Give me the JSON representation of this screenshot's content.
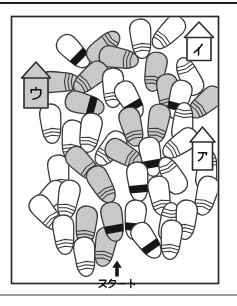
{
  "page": {
    "background": "#ffffff",
    "top_rule_color": "#1e1e1e",
    "bottom_rule_color": "#9b9b9b"
  },
  "figure": {
    "type": "footprint-maze-puzzle",
    "start_label": "スタート",
    "start_arrow": "up-arrow",
    "colors": {
      "outline": "#3a3a3a",
      "frame": "#2b2b2b",
      "white_sandal": "#ffffff",
      "gray_sandal": "#c8c8c8",
      "black_band": "#161616",
      "house_gray": "#cacaca",
      "house_white": "#ffffff",
      "text": "#111111"
    },
    "houses": [
      {
        "id": "i",
        "label": "イ",
        "fill": "#ffffff",
        "apex": [
          199,
          22
        ],
        "body": [
          187,
          37.5,
          24,
          23
        ]
      },
      {
        "id": "u",
        "label": "ウ",
        "fill": "#cacaca",
        "apex": [
          36,
          62
        ],
        "body": [
          24,
          78,
          24,
          30
        ]
      },
      {
        "id": "a",
        "label": "ア",
        "fill": "#ffffff",
        "apex": [
          202.5,
          127
        ],
        "body": [
          192.5,
          142,
          20,
          28
        ]
      }
    ],
    "footprint_fields": [
      "x",
      "y",
      "rotation_deg",
      "color",
      "band"
    ],
    "footprints": [
      [
        74,
        52,
        315,
        "white",
        "black"
      ],
      [
        104,
        47,
        225,
        "gray",
        "lines"
      ],
      [
        119,
        58,
        280,
        "gray",
        "lines"
      ],
      [
        141,
        39,
        355,
        "white",
        "lines"
      ],
      [
        168,
        33,
        45,
        "white",
        "lines"
      ],
      [
        60,
        82,
        270,
        "gray",
        "lines"
      ],
      [
        90,
        78,
        50,
        "gray",
        "lines"
      ],
      [
        113,
        88,
        0,
        "white",
        "lines"
      ],
      [
        85,
        104,
        285,
        "gray",
        "black"
      ],
      [
        155,
        72,
        10,
        "gray",
        "lines"
      ],
      [
        189,
        76,
        155,
        "white",
        "lines"
      ],
      [
        168,
        94,
        355,
        "gray",
        "lines"
      ],
      [
        130,
        100,
        330,
        "white",
        "black"
      ],
      [
        179,
        100,
        15,
        "white",
        "black"
      ],
      [
        205,
        103,
        50,
        "gray",
        "lines"
      ],
      [
        51,
        124,
        355,
        "white",
        "lines"
      ],
      [
        72,
        140,
        5,
        "white",
        "lines"
      ],
      [
        90,
        133,
        10,
        "white",
        "lines"
      ],
      [
        110,
        149,
        40,
        "white",
        "lines"
      ],
      [
        59,
        175,
        355,
        "white",
        "lines"
      ],
      [
        83,
        164,
        315,
        "gray",
        "lines"
      ],
      [
        102,
        185,
        330,
        "gray",
        "lines"
      ],
      [
        49,
        198,
        45,
        "white",
        "lines"
      ],
      [
        68,
        200,
        10,
        "white",
        "lines"
      ],
      [
        132,
        127,
        345,
        "gray",
        "lines"
      ],
      [
        158,
        124,
        10,
        "gray",
        "lines"
      ],
      [
        183,
        122,
        185,
        "white",
        "lines"
      ],
      [
        124,
        154,
        300,
        "gray",
        "lines"
      ],
      [
        151,
        157,
        350,
        "white",
        "black"
      ],
      [
        180,
        144,
        55,
        "white",
        "lines"
      ],
      [
        138,
        182,
        355,
        "white",
        "black"
      ],
      [
        172,
        175,
        150,
        "white",
        "lines"
      ],
      [
        207,
        170,
        185,
        "white",
        "lines"
      ],
      [
        160,
        196,
        350,
        "white",
        "lines"
      ],
      [
        206,
        196,
        15,
        "white",
        "lines"
      ],
      [
        46,
        213,
        320,
        "white",
        "lines"
      ],
      [
        64,
        235,
        355,
        "white",
        "lines"
      ],
      [
        86,
        226,
        5,
        "gray",
        "lines"
      ],
      [
        85,
        257,
        355,
        "white",
        "lines"
      ],
      [
        105,
        247,
        10,
        "gray",
        "lines"
      ],
      [
        113,
        222,
        350,
        "gray",
        "black"
      ],
      [
        135,
        220,
        5,
        "white",
        "black"
      ],
      [
        170,
        222,
        185,
        "white",
        "lines"
      ],
      [
        186,
        220,
        5,
        "white",
        "lines"
      ],
      [
        147,
        241,
        325,
        "white",
        "black"
      ],
      [
        171,
        240,
        5,
        "white",
        "lines"
      ]
    ]
  }
}
